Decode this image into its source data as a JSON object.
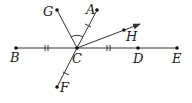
{
  "diagram": {
    "type": "geometry",
    "colors": {
      "line": "#333333",
      "point": "#111111",
      "label": "#222222"
    },
    "points": [
      {
        "id": "B",
        "label": "B",
        "x": 16,
        "y": 48,
        "lx": 10,
        "ly": 62
      },
      {
        "id": "C",
        "label": "C",
        "x": 77,
        "y": 48,
        "lx": 72,
        "ly": 63
      },
      {
        "id": "D",
        "label": "D",
        "x": 138,
        "y": 48,
        "lx": 133,
        "ly": 63
      },
      {
        "id": "E",
        "label": "E",
        "x": 177,
        "y": 48,
        "lx": 172,
        "ly": 63
      },
      {
        "id": "G",
        "label": "G",
        "x": 57,
        "y": 10,
        "lx": 43,
        "ly": 16
      },
      {
        "id": "A",
        "label": "A",
        "x": 97,
        "y": 10,
        "lx": 86,
        "ly": 14
      },
      {
        "id": "H",
        "label": "H",
        "x": 124,
        "y": 30,
        "lx": 126,
        "ly": 41
      },
      {
        "id": "F",
        "label": "F",
        "x": 57,
        "y": 87,
        "lx": 60,
        "ly": 92
      }
    ],
    "segments": [
      {
        "from": "B",
        "to": "E"
      },
      {
        "from": "C",
        "to": "G"
      },
      {
        "from": "C",
        "to": "A"
      },
      {
        "from": "C",
        "to": "F"
      }
    ],
    "rays": [
      {
        "from": "C",
        "through": "H",
        "tip_x": 140,
        "tip_y": 24
      }
    ],
    "marks": {
      "double_ticks": [
        "BC",
        "CD"
      ],
      "single_ticks": [
        "CA",
        "CF"
      ],
      "angle_arc": "GCA"
    }
  }
}
